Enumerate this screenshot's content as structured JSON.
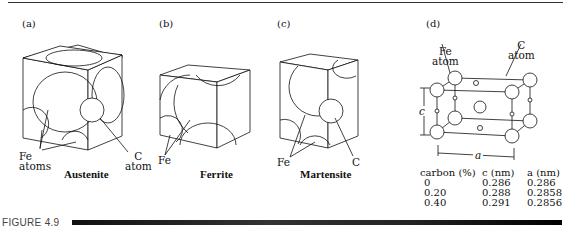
{
  "panels": [
    {
      "tag": "(a)",
      "caption": "Austenite",
      "labels": [
        "Fe",
        "atoms",
        "C",
        "atom"
      ]
    },
    {
      "tag": "(b)",
      "caption": "Ferrite",
      "labels": [
        "Fe"
      ]
    },
    {
      "tag": "(c)",
      "caption": "Martensite",
      "labels": [
        "Fe",
        "C"
      ]
    },
    {
      "tag": "(d)",
      "caption": "",
      "labels": [
        "Fe",
        "atom",
        "C",
        "atom",
        "c",
        "a"
      ]
    }
  ],
  "table": {
    "headers": [
      "carbon (%)",
      "c (nm)",
      "a (nm)"
    ],
    "rows": [
      [
        "0",
        "0.286",
        "0.286"
      ],
      [
        "0.20",
        "0.288",
        "0.2858"
      ],
      [
        "0.40",
        "0.291",
        "0.2856"
      ]
    ]
  },
  "figure_label": "FIGURE 4.9"
}
